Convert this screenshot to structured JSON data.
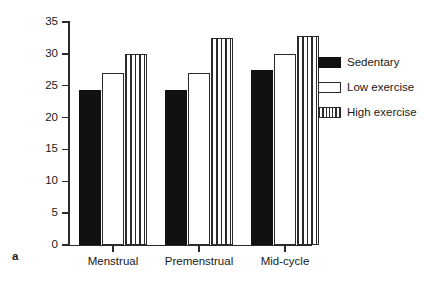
{
  "panel": {
    "label": "a"
  },
  "chart_data": {
    "type": "bar",
    "title": "",
    "xlabel": "",
    "ylabel": "Score",
    "ylim": [
      0,
      35
    ],
    "yticks": [
      0,
      5,
      10,
      15,
      20,
      25,
      30,
      35
    ],
    "ytick_labels": [
      "0",
      "5",
      "10",
      "15",
      "20",
      "25",
      "30",
      "35"
    ],
    "grid": false,
    "legend_position": "right",
    "categories": [
      "Menstrual",
      "Premenstrual",
      "Mid-cycle"
    ],
    "series": [
      {
        "name": "Sedentary",
        "fill": "solid-black",
        "color": "#111111",
        "values": [
          24.4,
          24.3,
          27.5
        ]
      },
      {
        "name": "Low exercise",
        "fill": "white-outline",
        "color": "#ffffff",
        "values": [
          27.0,
          27.0,
          30.0
        ]
      },
      {
        "name": "High exercise",
        "fill": "vertical-hatch",
        "color": "#2b2b2b",
        "values": [
          30.0,
          32.5,
          32.8
        ]
      }
    ]
  },
  "axes": {
    "y_title": "Score"
  },
  "legend": {
    "entries": [
      {
        "label": "Sedentary"
      },
      {
        "label": "Low exercise"
      },
      {
        "label": "High exercise"
      }
    ]
  },
  "colors": {
    "axis": "#2b2b2b",
    "text": "#1a1a1a",
    "background": "#ffffff",
    "sedentary": "#111111",
    "low_exercise": "#ffffff",
    "high_exercise": "#2b2b2b"
  }
}
